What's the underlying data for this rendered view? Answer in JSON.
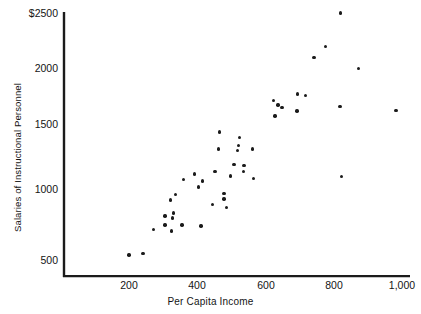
{
  "chart_data": {
    "type": "scatter",
    "title": "",
    "xlabel": "Per Capita Income",
    "ylabel": "Salaries of Instructional Personnel",
    "xlim": [
      80,
      1040
    ],
    "ylim": [
      400,
      2560
    ],
    "grid": false,
    "legend": null,
    "xticks": [
      {
        "value": 200,
        "label": "200"
      },
      {
        "value": 400,
        "label": "400"
      },
      {
        "value": 600,
        "label": "600"
      },
      {
        "value": 800,
        "label": "800"
      },
      {
        "value": 1000,
        "label": "1,000"
      }
    ],
    "yticks": [
      {
        "value": 2500,
        "label": "$2500"
      },
      {
        "value": 2000,
        "label": "2000"
      },
      {
        "value": 1500,
        "label": "1500"
      },
      {
        "value": 1000,
        "label": "1000"
      },
      {
        "value": 500,
        "label": "500"
      }
    ],
    "marker": {
      "shape": "circle",
      "color": "#1b1b1b",
      "size": 3.4
    },
    "axis_color": "#1b1b1b",
    "points": [
      {
        "x": 200,
        "y": 540
      },
      {
        "x": 241,
        "y": 555
      },
      {
        "x": 271,
        "y": 745
      },
      {
        "x": 305,
        "y": 855
      },
      {
        "x": 322,
        "y": 985
      },
      {
        "x": 306,
        "y": 785
      },
      {
        "x": 330,
        "y": 880
      },
      {
        "x": 327,
        "y": 840
      },
      {
        "x": 337,
        "y": 1030
      },
      {
        "x": 325,
        "y": 735
      },
      {
        "x": 355,
        "y": 785
      },
      {
        "x": 360,
        "y": 1150
      },
      {
        "x": 392,
        "y": 1195
      },
      {
        "x": 403,
        "y": 1090
      },
      {
        "x": 415,
        "y": 1140
      },
      {
        "x": 411,
        "y": 775
      },
      {
        "x": 444,
        "y": 950
      },
      {
        "x": 452,
        "y": 1215
      },
      {
        "x": 462,
        "y": 1400
      },
      {
        "x": 465,
        "y": 1535
      },
      {
        "x": 478,
        "y": 1040
      },
      {
        "x": 478,
        "y": 995
      },
      {
        "x": 486,
        "y": 925
      },
      {
        "x": 498,
        "y": 1180
      },
      {
        "x": 508,
        "y": 1275
      },
      {
        "x": 518,
        "y": 1385
      },
      {
        "x": 520,
        "y": 1425
      },
      {
        "x": 523,
        "y": 1490
      },
      {
        "x": 537,
        "y": 1265
      },
      {
        "x": 536,
        "y": 1215
      },
      {
        "x": 562,
        "y": 1400
      },
      {
        "x": 565,
        "y": 1160
      },
      {
        "x": 624,
        "y": 1790
      },
      {
        "x": 637,
        "y": 1755
      },
      {
        "x": 628,
        "y": 1665
      },
      {
        "x": 648,
        "y": 1735
      },
      {
        "x": 694,
        "y": 1845
      },
      {
        "x": 692,
        "y": 1705
      },
      {
        "x": 717,
        "y": 1830
      },
      {
        "x": 742,
        "y": 2140
      },
      {
        "x": 776,
        "y": 2230
      },
      {
        "x": 820,
        "y": 2500
      },
      {
        "x": 872,
        "y": 2050
      },
      {
        "x": 818,
        "y": 1745
      },
      {
        "x": 823,
        "y": 1175
      },
      {
        "x": 982,
        "y": 1710
      }
    ]
  }
}
